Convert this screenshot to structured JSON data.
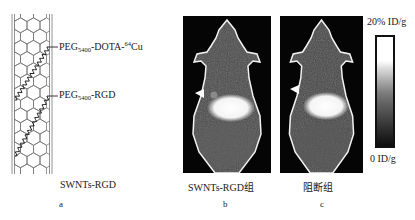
{
  "figure": {
    "panel_a": {
      "letter": "a",
      "caption": "SWNTs-RGD",
      "illustration": "single-walled-carbon-nanotube-with-peg-chains",
      "annotations": [
        {
          "base": "PEG",
          "sub": "5400",
          "rest": "-DOTA-",
          "sup": "64",
          "tail": "Cu"
        },
        {
          "base": "PEG",
          "sub": "5400",
          "rest": "-RGD",
          "sup": "",
          "tail": ""
        }
      ]
    },
    "panel_b": {
      "letter": "b",
      "caption": "SWNTs-RGD组",
      "image": "pet-scan-mouse-coronal",
      "marker": "white-arrowhead-tumor"
    },
    "panel_c": {
      "letter": "c",
      "caption": "阻断组",
      "image": "pet-scan-mouse-coronal-blocking",
      "marker": "white-arrowhead-tumor"
    },
    "colorbar": {
      "max_label": "20% ID/g",
      "min_label": "0 ID/g",
      "colors": {
        "top": "#ffffff",
        "bottom": "#0d0d0d"
      }
    }
  }
}
